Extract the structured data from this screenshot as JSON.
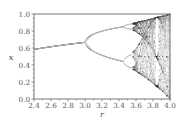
{
  "chart_data": {
    "type": "scatter",
    "title": "",
    "subtitle": "Bifurcation diagram of the logistic map x(n+1) = r·x(n)·(1 − x(n))",
    "xlabel": "r",
    "ylabel": "x",
    "xlim": [
      2.4,
      4.0
    ],
    "ylim": [
      0.0,
      1.0
    ],
    "grid": false,
    "legend": null,
    "x_ticks": [
      "2.4",
      "2.6",
      "2.8",
      "3.0",
      "3.2",
      "3.4",
      "3.6",
      "3.8",
      "4.0"
    ],
    "y_ticks": [
      "0.0",
      "0.2",
      "0.4",
      "0.6",
      "0.8",
      "1.0"
    ],
    "series": [
      {
        "name": "period-1 fixed point",
        "x": [
          2.4,
          2.6,
          2.8,
          3.0
        ],
        "y": [
          0.583,
          0.615,
          0.643,
          0.667
        ]
      },
      {
        "name": "period-2 upper branch",
        "x": [
          3.0,
          3.1,
          3.2,
          3.3,
          3.4,
          3.449
        ],
        "y": [
          0.667,
          0.765,
          0.799,
          0.824,
          0.842,
          0.849
        ]
      },
      {
        "name": "period-2 lower branch",
        "x": [
          3.0,
          3.1,
          3.2,
          3.3,
          3.4,
          3.449
        ],
        "y": [
          0.667,
          0.558,
          0.513,
          0.479,
          0.452,
          0.44
        ]
      },
      {
        "name": "chaotic region",
        "x_range": [
          3.57,
          4.0
        ],
        "y_range_at_4.0": [
          0.0,
          1.0
        ]
      }
    ],
    "annotations": [
      "period-3 window near r≈3.83"
    ]
  },
  "colors": {
    "axis": "#555555",
    "curve": "#bdbdbd",
    "chaos_dark": "#3a3a3a",
    "background": "#ffffff"
  }
}
